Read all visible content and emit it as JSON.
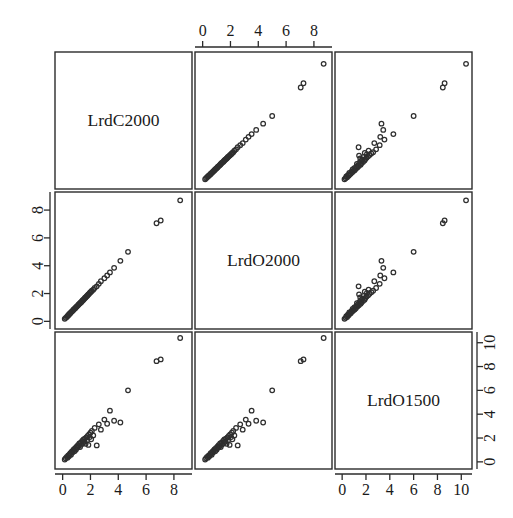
{
  "figure": {
    "type": "scatterplot-matrix",
    "title": "",
    "background_color": "#ffffff",
    "foreground_color": "#2b2b2b",
    "point_color": "#2f2f2f",
    "point_symbol": "open-circle",
    "n_rows": 3,
    "n_cols": 3,
    "panel_size_px": 137,
    "grid_origin_px": {
      "x": 55,
      "y": 52
    },
    "panel_gap_px": 3
  },
  "chart_data": {
    "type": "scatter",
    "title": "",
    "xlabel": "",
    "ylabel": "",
    "grid": false,
    "legend": null,
    "matrix_layout": "pairs",
    "variables": [
      {
        "index": 0,
        "name": "LrdC2000",
        "axis_ticks": [
          0,
          2,
          4,
          6,
          8
        ],
        "tick_labels": [
          "0",
          "2",
          "4",
          "6",
          "8"
        ],
        "lim": [
          -0.55,
          9.3
        ],
        "bottom_axis": true,
        "top_axis": false,
        "left_axis": false,
        "right_axis": false
      },
      {
        "index": 1,
        "name": "LrdO2000",
        "axis_ticks": [
          0,
          2,
          4,
          6,
          8
        ],
        "tick_labels": [
          "0",
          "2",
          "4",
          "6",
          "8"
        ],
        "lim": [
          -0.55,
          9.3
        ],
        "bottom_axis": false,
        "top_axis": true,
        "left_axis": true,
        "right_axis": false
      },
      {
        "index": 2,
        "name": "LrdO1500",
        "axis_ticks": [
          0,
          2,
          4,
          6,
          8,
          10
        ],
        "tick_labels": [
          "0",
          "2",
          "4",
          "6",
          "8",
          "10"
        ],
        "lim": [
          -0.6,
          10.9
        ],
        "bottom_axis": true,
        "top_axis": false,
        "left_axis": false,
        "right_axis": true
      }
    ],
    "observations": [
      {
        "LrdC2000": 0.15,
        "LrdO2000": 0.18,
        "LrdO1500": 0.2
      },
      {
        "LrdC2000": 0.22,
        "LrdO2000": 0.25,
        "LrdO1500": 0.3
      },
      {
        "LrdC2000": 0.3,
        "LrdO2000": 0.32,
        "LrdO1500": 0.42
      },
      {
        "LrdC2000": 0.35,
        "LrdO2000": 0.38,
        "LrdO1500": 0.35
      },
      {
        "LrdC2000": 0.4,
        "LrdO2000": 0.44,
        "LrdO1500": 0.55
      },
      {
        "LrdC2000": 0.45,
        "LrdO2000": 0.48,
        "LrdO1500": 0.48
      },
      {
        "LrdC2000": 0.5,
        "LrdO2000": 0.55,
        "LrdO1500": 0.62
      },
      {
        "LrdC2000": 0.55,
        "LrdO2000": 0.58,
        "LrdO1500": 0.72
      },
      {
        "LrdC2000": 0.6,
        "LrdO2000": 0.65,
        "LrdO1500": 0.6
      },
      {
        "LrdC2000": 0.65,
        "LrdO2000": 0.7,
        "LrdO1500": 0.85
      },
      {
        "LrdC2000": 0.7,
        "LrdO2000": 0.74,
        "LrdO1500": 0.78
      },
      {
        "LrdC2000": 0.75,
        "LrdO2000": 0.8,
        "LrdO1500": 0.95
      },
      {
        "LrdC2000": 0.8,
        "LrdO2000": 0.85,
        "LrdO1500": 1.05
      },
      {
        "LrdC2000": 0.85,
        "LrdO2000": 0.9,
        "LrdO1500": 0.88
      },
      {
        "LrdC2000": 0.9,
        "LrdO2000": 0.95,
        "LrdO1500": 1.15
      },
      {
        "LrdC2000": 0.95,
        "LrdO2000": 1.0,
        "LrdO1500": 1.02
      },
      {
        "LrdC2000": 1.0,
        "LrdO2000": 1.06,
        "LrdO1500": 1.28
      },
      {
        "LrdC2000": 1.05,
        "LrdO2000": 1.1,
        "LrdO1500": 1.18
      },
      {
        "LrdC2000": 1.1,
        "LrdO2000": 1.15,
        "LrdO1500": 1.4
      },
      {
        "LrdC2000": 1.15,
        "LrdO2000": 1.22,
        "LrdO1500": 1.32
      },
      {
        "LrdC2000": 1.2,
        "LrdO2000": 1.26,
        "LrdO1500": 1.55
      },
      {
        "LrdC2000": 1.25,
        "LrdO2000": 1.3,
        "LrdO1500": 1.24
      },
      {
        "LrdC2000": 1.3,
        "LrdO2000": 1.36,
        "LrdO1500": 1.62
      },
      {
        "LrdC2000": 1.35,
        "LrdO2000": 1.4,
        "LrdO1500": 1.45
      },
      {
        "LrdC2000": 1.4,
        "LrdO2000": 1.47,
        "LrdO1500": 1.75
      },
      {
        "LrdC2000": 1.45,
        "LrdO2000": 1.52,
        "LrdO1500": 1.58
      },
      {
        "LrdC2000": 1.5,
        "LrdO2000": 1.56,
        "LrdO1500": 1.88
      },
      {
        "LrdC2000": 1.55,
        "LrdO2000": 1.62,
        "LrdO1500": 1.7
      },
      {
        "LrdC2000": 1.6,
        "LrdO2000": 1.68,
        "LrdO1500": 1.95
      },
      {
        "LrdC2000": 1.65,
        "LrdO2000": 1.72,
        "LrdO1500": 1.52
      },
      {
        "LrdC2000": 1.7,
        "LrdO2000": 1.78,
        "LrdO1500": 2.05
      },
      {
        "LrdC2000": 1.75,
        "LrdO2000": 1.82,
        "LrdO1500": 1.8
      },
      {
        "LrdC2000": 1.8,
        "LrdO2000": 1.88,
        "LrdO1500": 2.18
      },
      {
        "LrdC2000": 1.85,
        "LrdO2000": 1.94,
        "LrdO1500": 1.42
      },
      {
        "LrdC2000": 1.9,
        "LrdO2000": 1.98,
        "LrdO1500": 2.3
      },
      {
        "LrdC2000": 1.95,
        "LrdO2000": 2.05,
        "LrdO1500": 2.08
      },
      {
        "LrdC2000": 2.0,
        "LrdO2000": 2.1,
        "LrdO1500": 2.45
      },
      {
        "LrdC2000": 2.05,
        "LrdO2000": 2.14,
        "LrdO1500": 1.9
      },
      {
        "LrdC2000": 2.1,
        "LrdO2000": 2.2,
        "LrdO1500": 2.6
      },
      {
        "LrdC2000": 2.2,
        "LrdO2000": 2.28,
        "LrdO1500": 2.22
      },
      {
        "LrdC2000": 2.3,
        "LrdO2000": 2.4,
        "LrdO1500": 2.85
      },
      {
        "LrdC2000": 2.45,
        "LrdO2000": 2.52,
        "LrdO1500": 1.38
      },
      {
        "LrdC2000": 2.6,
        "LrdO2000": 2.7,
        "LrdO1500": 3.15
      },
      {
        "LrdC2000": 2.75,
        "LrdO2000": 2.88,
        "LrdO1500": 2.7
      },
      {
        "LrdC2000": 3.0,
        "LrdO2000": 3.1,
        "LrdO1500": 3.55
      },
      {
        "LrdC2000": 3.2,
        "LrdO2000": 3.3,
        "LrdO1500": 3.2
      },
      {
        "LrdC2000": 3.4,
        "LrdO2000": 3.52,
        "LrdO1500": 4.3
      },
      {
        "LrdC2000": 3.7,
        "LrdO2000": 3.85,
        "LrdO1500": 3.45
      },
      {
        "LrdC2000": 4.15,
        "LrdO2000": 4.35,
        "LrdO1500": 3.3
      },
      {
        "LrdC2000": 4.7,
        "LrdO2000": 5.0,
        "LrdO1500": 6.0
      },
      {
        "LrdC2000": 6.75,
        "LrdO2000": 7.05,
        "LrdO1500": 8.45
      },
      {
        "LrdC2000": 7.05,
        "LrdO2000": 7.25,
        "LrdO1500": 8.6
      },
      {
        "LrdC2000": 8.45,
        "LrdO2000": 8.7,
        "LrdO1500": 10.4
      }
    ],
    "panels": [
      {
        "row": 0,
        "col": 0,
        "kind": "diagonal",
        "label": "LrdC2000"
      },
      {
        "row": 0,
        "col": 1,
        "kind": "scatter",
        "x_var": "LrdO2000",
        "y_var": "LrdC2000"
      },
      {
        "row": 0,
        "col": 2,
        "kind": "scatter",
        "x_var": "LrdO1500",
        "y_var": "LrdC2000"
      },
      {
        "row": 1,
        "col": 0,
        "kind": "scatter",
        "x_var": "LrdC2000",
        "y_var": "LrdO2000"
      },
      {
        "row": 1,
        "col": 1,
        "kind": "diagonal",
        "label": "LrdO2000"
      },
      {
        "row": 1,
        "col": 2,
        "kind": "scatter",
        "x_var": "LrdO1500",
        "y_var": "LrdO2000"
      },
      {
        "row": 2,
        "col": 0,
        "kind": "scatter",
        "x_var": "LrdC2000",
        "y_var": "LrdO1500"
      },
      {
        "row": 2,
        "col": 1,
        "kind": "scatter",
        "x_var": "LrdO2000",
        "y_var": "LrdO1500"
      },
      {
        "row": 2,
        "col": 2,
        "kind": "diagonal",
        "label": "LrdO1500"
      }
    ]
  }
}
